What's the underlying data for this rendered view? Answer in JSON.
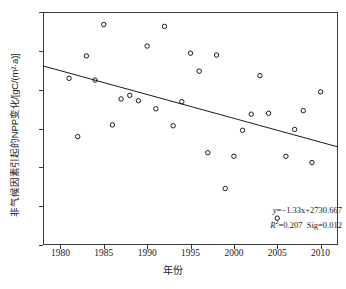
{
  "chart_data": {
    "type": "scatter",
    "title": "",
    "xlabel": "年份",
    "ylabel": "非气候因素引起的NPP变化/[gC/(m²·a)]",
    "xlim": [
      1978,
      2012
    ],
    "ylim": [
      0,
      130
    ],
    "xticks": [
      1980,
      1985,
      1990,
      1995,
      2000,
      2005,
      2010
    ],
    "yticks": [
      0,
      20,
      40,
      60,
      80,
      100,
      120
    ],
    "grid": false,
    "legend": false,
    "x": [
      1981,
      1982,
      1983,
      1984,
      1985,
      1986,
      1987,
      1988,
      1989,
      1990,
      1991,
      1992,
      1993,
      1994,
      1995,
      1996,
      1997,
      1998,
      1999,
      2000,
      2001,
      2002,
      2003,
      2004,
      2005,
      2006,
      2007,
      2008,
      2009,
      2010
    ],
    "y": [
      93,
      60.5,
      105.5,
      92,
      123,
      67,
      81.5,
      83.5,
      80.5,
      111,
      76,
      122,
      66.5,
      80,
      107,
      97,
      51.5,
      106,
      31.5,
      49.5,
      64,
      73,
      94.5,
      73.5,
      15,
      49.5,
      64.5,
      75,
      46,
      85.5
    ],
    "series": [
      {
        "name": "非气候因素引起的NPP变化",
        "marker": "open-circle",
        "color": "#1a1a1a",
        "values": [
          93,
          60.5,
          105.5,
          92,
          123,
          67,
          81.5,
          83.5,
          80.5,
          111,
          76,
          122,
          66.5,
          80,
          107,
          97,
          51.5,
          106,
          31.5,
          49.5,
          64,
          73,
          94.5,
          73.5,
          15,
          49.5,
          64.5,
          75,
          46,
          85.5
        ]
      }
    ],
    "trendline": {
      "type": "linear",
      "slope": -1.33,
      "intercept": 2730.667,
      "x_start": 1978,
      "x_end": 2012,
      "color": "#1a1a1a"
    },
    "annotations": {
      "equation_prefix": "y",
      "equation_body": "=−1.33x+2730.667",
      "r_squared_symbol": "R",
      "r_squared_exponent": "2",
      "r_squared_value": "=0.207",
      "significance": "Sig=0.012"
    }
  },
  "axes": {
    "x_title": "年份",
    "y_title": "非气候因素引起的NPP变化/[gC/(m²·a)]",
    "x_tick_labels": [
      "1980",
      "1985",
      "1990",
      "1995",
      "2000",
      "2005",
      "2010"
    ],
    "y_tick_labels": [
      "0",
      "20",
      "40",
      "60",
      "80",
      "100",
      "120"
    ]
  },
  "caption": ""
}
